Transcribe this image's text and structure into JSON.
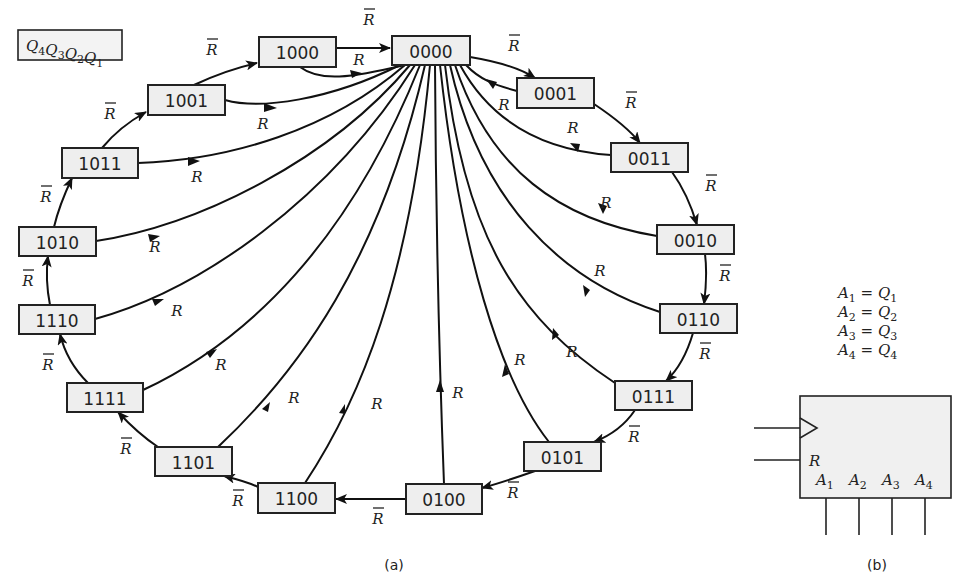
{
  "legend_box": {
    "label": "Q4Q3Q2Q1",
    "parts": [
      {
        "q": "Q",
        "s": "4"
      },
      {
        "q": "Q",
        "s": "3"
      },
      {
        "q": "Q",
        "s": "2"
      },
      {
        "q": "Q",
        "s": "1"
      }
    ]
  },
  "states": [
    {
      "id": "0000",
      "label": "0000",
      "x": 392,
      "y": 36,
      "w": 78,
      "h": 29
    },
    {
      "id": "0001",
      "label": "0001",
      "x": 517,
      "y": 78,
      "w": 77,
      "h": 30
    },
    {
      "id": "0011",
      "label": "0011",
      "x": 611,
      "y": 143,
      "w": 77,
      "h": 29
    },
    {
      "id": "0010",
      "label": "0010",
      "x": 657,
      "y": 225,
      "w": 77,
      "h": 29
    },
    {
      "id": "0110",
      "label": "0110",
      "x": 660,
      "y": 304,
      "w": 77,
      "h": 29
    },
    {
      "id": "0111",
      "label": "0111",
      "x": 615,
      "y": 381,
      "w": 77,
      "h": 29
    },
    {
      "id": "0101",
      "label": "0101",
      "x": 524,
      "y": 442,
      "w": 77,
      "h": 29
    },
    {
      "id": "0100",
      "label": "0100",
      "x": 406,
      "y": 484,
      "w": 76,
      "h": 30
    },
    {
      "id": "1100",
      "label": "1100",
      "x": 258,
      "y": 483,
      "w": 77,
      "h": 30
    },
    {
      "id": "1101",
      "label": "1101",
      "x": 155,
      "y": 447,
      "w": 77,
      "h": 29
    },
    {
      "id": "1111",
      "label": "1111",
      "x": 67,
      "y": 383,
      "w": 76,
      "h": 29
    },
    {
      "id": "1110",
      "label": "1110",
      "x": 19,
      "y": 305,
      "w": 76,
      "h": 29
    },
    {
      "id": "1010",
      "label": "1010",
      "x": 19,
      "y": 227,
      "w": 77,
      "h": 29
    },
    {
      "id": "1011",
      "label": "1011",
      "x": 62,
      "y": 148,
      "w": 76,
      "h": 30
    },
    {
      "id": "1001",
      "label": "1001",
      "x": 148,
      "y": 85,
      "w": 77,
      "h": 30
    },
    {
      "id": "1000",
      "label": "1000",
      "x": 259,
      "y": 37,
      "w": 77,
      "h": 30
    }
  ],
  "transition_labels": {
    "not_reset": "R",
    "reset": "R"
  },
  "sequence": [
    "0000",
    "0001",
    "0011",
    "0010",
    "0110",
    "0111",
    "0101",
    "0100",
    "1100",
    "1101",
    "1111",
    "1110",
    "1010",
    "1011",
    "1001",
    "1000",
    "0000"
  ],
  "equations": [
    {
      "a": "A",
      "as": "1",
      "q": "Q",
      "qs": "1"
    },
    {
      "a": "A",
      "as": "2",
      "q": "Q",
      "qs": "2"
    },
    {
      "a": "A",
      "as": "3",
      "q": "Q",
      "qs": "3"
    },
    {
      "a": "A",
      "as": "4",
      "q": "Q",
      "qs": "4"
    }
  ],
  "block": {
    "reset_label": "R",
    "outputs": [
      {
        "a": "A",
        "s": "1"
      },
      {
        "a": "A",
        "s": "2"
      },
      {
        "a": "A",
        "s": "3"
      },
      {
        "a": "A",
        "s": "4"
      }
    ]
  },
  "captions": {
    "a": "(a)",
    "b": "(b)"
  }
}
